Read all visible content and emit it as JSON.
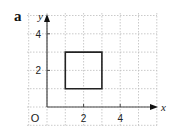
{
  "panel_label": "a",
  "chart_data": {
    "type": "scatter",
    "title": "",
    "xlabel": "x",
    "ylabel": "y",
    "origin_label": "O",
    "xlim": [
      -1,
      5.5
    ],
    "ylim": [
      -1,
      5
    ],
    "x_ticks": [
      2,
      4
    ],
    "y_ticks": [
      2,
      4
    ],
    "grid": true,
    "grid_style": "dotted",
    "shapes": [
      {
        "name": "square",
        "vertices": [
          [
            1,
            1
          ],
          [
            3,
            1
          ],
          [
            3,
            3
          ],
          [
            1,
            3
          ]
        ],
        "closed": true
      }
    ]
  },
  "colors": {
    "axis": "#444444",
    "grid": "#bdbdbd",
    "shape": "#222222",
    "text": "#222222"
  }
}
